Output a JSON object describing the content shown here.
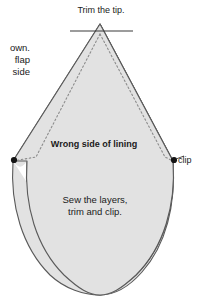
{
  "figure": {
    "kind": "sewing-pattern-diagram",
    "title": "Trim the tip.",
    "colors": {
      "fabric_fill": "#e2e2e2",
      "outline": "#4d4d4d",
      "stitch_line": "#808080",
      "marker_dot": "#111111",
      "text": "#1a1a1a",
      "background": "#ffffff"
    },
    "labels": {
      "trim_tip": "Trim the tip.",
      "side_note": "own.\nflap\nside",
      "wrong_side": "Wrong side of lining",
      "clip": "clip",
      "sew_layers": "Sew the layers,\ntrim and clip."
    },
    "markers": {
      "left_dot_label": "clip-point-left",
      "right_dot_label": "clip-point-right"
    },
    "geometry": {
      "apex_x": 100,
      "apex_y": 24,
      "left_shoulder_x": 13,
      "right_shoulder_x": 173,
      "shoulder_y": 161,
      "bottom_y": 295,
      "trim_line_y": 31,
      "trim_line_x1": 70,
      "trim_line_x2": 133
    }
  }
}
